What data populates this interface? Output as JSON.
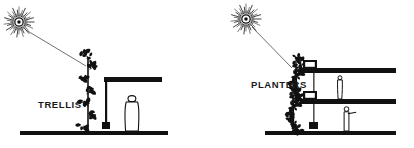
{
  "figure": {
    "background_color": "#ffffff",
    "ink_color": "#111111",
    "width": 414,
    "height": 148
  },
  "panels": [
    {
      "id": "trellis",
      "label": "TRELLIS",
      "label_x": 38,
      "label_y": 108,
      "sun": {
        "name": "sun-icon",
        "cx": 19,
        "cy": 22,
        "core_r": 4.2,
        "ray_count": 44,
        "ray_inner": 5.5,
        "ray_outer": 15.5
      },
      "sun_ray": {
        "x1": 26,
        "y1": 30,
        "x2": 86,
        "y2": 66
      },
      "ground": {
        "x1": 20,
        "y1": 131,
        "x2": 168,
        "y2": 131,
        "thickness": 4
      },
      "vine": {
        "name": "climbing-vine",
        "base_x": 88,
        "base_y": 131,
        "top_y": 57,
        "leaf_clusters": 7
      },
      "canopy": {
        "name": "roof-slab",
        "x": 104,
        "y": 77,
        "w": 58,
        "h": 5
      },
      "column": {
        "name": "support-column",
        "x": 105,
        "y": 82,
        "w": 2.2,
        "h": 44,
        "footing": {
          "x": 102,
          "y": 122,
          "w": 8,
          "h": 7
        }
      },
      "person": {
        "name": "human-figure-standing",
        "x": 128,
        "y": 96,
        "h": 35
      }
    },
    {
      "id": "planters",
      "label": "PLANTERS",
      "label_x": 251,
      "label_y": 88,
      "sun": {
        "name": "sun-icon",
        "cx": 246,
        "cy": 19,
        "core_r": 4.2,
        "ray_count": 44,
        "ray_inner": 5.5,
        "ray_outer": 15.5
      },
      "sun_ray": {
        "x1": 252,
        "y1": 27,
        "x2": 292,
        "y2": 68
      },
      "ground": {
        "x1": 265,
        "y1": 131,
        "x2": 396,
        "y2": 131,
        "thickness": 4
      },
      "column": {
        "name": "support-column",
        "x": 313,
        "y": 60,
        "w": 1.6,
        "h": 65,
        "footing": {
          "x": 309,
          "y": 122,
          "w": 9,
          "h": 7
        }
      },
      "floors": [
        {
          "name": "upper-floor-slab",
          "x": 300,
          "y": 68,
          "w": 96,
          "h": 5,
          "planter": {
            "x": 303,
            "y": 60,
            "w": 14,
            "h": 9
          }
        },
        {
          "name": "lower-floor-slab",
          "x": 300,
          "y": 99,
          "w": 96,
          "h": 5,
          "planter": {
            "x": 303,
            "y": 91,
            "w": 14,
            "h": 9
          }
        }
      ],
      "vines": [
        {
          "name": "cascading-vine-upper",
          "x": 297,
          "top_y": 57,
          "bottom_y": 98
        },
        {
          "name": "cascading-vine-lower",
          "x": 294,
          "top_y": 88,
          "bottom_y": 129
        }
      ],
      "people": [
        {
          "name": "human-figure-standing-upper",
          "x": 338,
          "y": 76,
          "h": 23
        },
        {
          "name": "human-figure-pointing-lower",
          "x": 344,
          "y": 107,
          "h": 24
        }
      ]
    }
  ]
}
